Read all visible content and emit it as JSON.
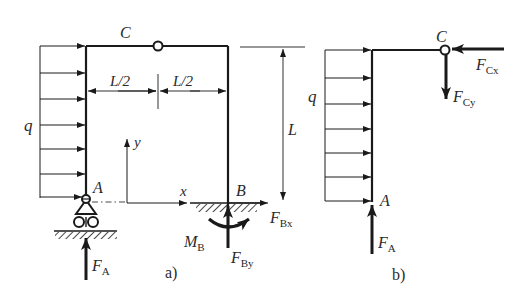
{
  "figure_a": {
    "caption": "a)",
    "hinge_label": "C",
    "support_left_label": "A",
    "support_right_label": "B",
    "load_label": "q",
    "dim_half_left": "L/2",
    "dim_half_right": "L/2",
    "dim_height": "L",
    "axis_x": "x",
    "axis_y": "y",
    "force_A": {
      "main": "F",
      "sub": "A"
    },
    "force_Bx": {
      "main": "F",
      "sub": "Bx"
    },
    "force_By": {
      "main": "F",
      "sub": "By"
    },
    "moment_B": {
      "main": "M",
      "sub": "B"
    }
  },
  "figure_b": {
    "caption": "b)",
    "hinge_label": "C",
    "point_label": "A",
    "load_label": "q",
    "force_A": {
      "main": "F",
      "sub": "A"
    },
    "force_Cx": {
      "main": "F",
      "sub": "Cx"
    },
    "force_Cy": {
      "main": "F",
      "sub": "Cy"
    }
  },
  "colors": {
    "line": "#1a1a1a",
    "text": "#2a2a2a",
    "background": "#ffffff"
  }
}
